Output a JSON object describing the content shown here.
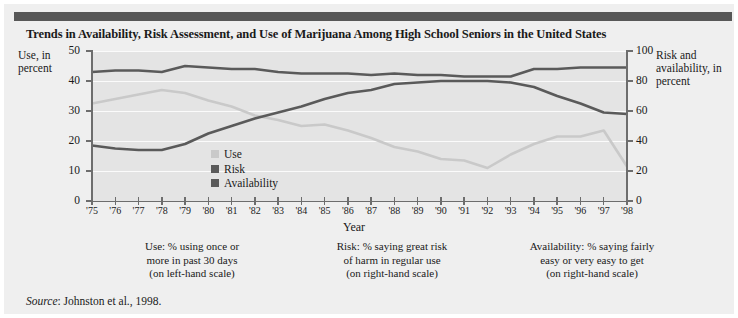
{
  "figure": {
    "title": "Trends in Availability, Risk Assessment, and Use of Marijuana Among High School Seniors in the United States",
    "source_prefix": "Source",
    "source_text": ": Johnston et al., 1998."
  },
  "axes": {
    "left_title": "Use, in percent",
    "right_title": "Risk and availability, in percent",
    "x_title": "Year"
  },
  "legend": {
    "items": [
      {
        "label": "Use",
        "color": "#c9c9c9"
      },
      {
        "label": "Risk",
        "color": "#5a5a5a"
      },
      {
        "label": "Availability",
        "color": "#5a5a5a"
      }
    ]
  },
  "notes": [
    "Use: % using once or more in past 30 days (on left-hand scale)",
    "Risk: % saying great risk of harm in regular use (on right-hand scale)",
    "Availability: % saying fairly easy or very easy to get (on right-hand scale)"
  ],
  "notes_lines": [
    [
      "Use: % using once or",
      "more in past 30 days",
      "(on left-hand scale)"
    ],
    [
      "Risk: % saying great risk",
      "of harm in regular use",
      "(on right-hand scale)"
    ],
    [
      "Availability: % saying fairly",
      "easy or very easy to get",
      "(on right-hand scale)"
    ]
  ],
  "colors": {
    "panel": "#efefef",
    "plot": "#e4e4e4",
    "gridline": "#fbfbfb",
    "axis": "#6d6d6d",
    "topbar": "#575757",
    "use": "#c9c9c9",
    "risk": "#5a5a5a",
    "availability": "#5a5a5a"
  },
  "chart_data": {
    "type": "line",
    "title": "Trends in Availability, Risk Assessment, and Use of Marijuana Among High School Seniors in the United States",
    "xlabel": "Year",
    "ylabel": "Use, in percent",
    "y2label": "Risk and availability, in percent",
    "grid": true,
    "legend_position": "inside-lower-left",
    "x": [
      "'75",
      "'76",
      "'77",
      "'78",
      "'79",
      "'80",
      "'81",
      "'82",
      "'83",
      "'84",
      "'85",
      "'86",
      "'87",
      "'88",
      "'89",
      "'90",
      "'91",
      "'92",
      "'93",
      "'94",
      "'95",
      "'96",
      "'97",
      "'98"
    ],
    "xlim": [
      0,
      23
    ],
    "ylim": [
      0,
      50
    ],
    "y2lim": [
      0,
      100
    ],
    "yticks": [
      0,
      10,
      20,
      30,
      40,
      50
    ],
    "y2ticks": [
      0,
      20,
      40,
      60,
      80,
      100
    ],
    "series": [
      {
        "name": "Use",
        "axis": "left",
        "units": "percent using once or more in past 30 days",
        "color": "#c9c9c9",
        "values": [
          32.5,
          34.0,
          35.5,
          37.0,
          36.0,
          33.5,
          31.5,
          28.5,
          27.0,
          25.0,
          25.5,
          23.5,
          21.0,
          18.0,
          16.5,
          14.0,
          13.5,
          11.0,
          15.5,
          19.0,
          21.5,
          21.5,
          23.5,
          11.5
        ]
      },
      {
        "name": "Risk",
        "axis": "right",
        "units": "percent saying great risk of harm in regular use",
        "color": "#5a5a5a",
        "values": [
          37,
          35,
          34,
          34,
          38,
          45,
          50,
          55,
          59,
          63,
          68,
          72,
          74,
          78,
          79,
          80,
          80,
          80,
          79,
          76,
          70,
          65,
          59,
          58
        ]
      },
      {
        "name": "Availability",
        "axis": "right",
        "units": "percent saying fairly easy or very easy to get",
        "color": "#5a5a5a",
        "values": [
          86,
          87,
          87,
          86,
          90,
          89,
          88,
          88,
          86,
          85,
          85,
          85,
          84,
          85,
          84,
          84,
          83,
          83,
          83,
          88,
          88,
          89,
          89,
          89
        ]
      }
    ]
  }
}
